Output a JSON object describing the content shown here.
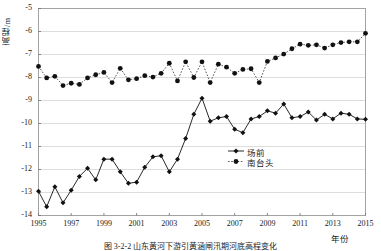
{
  "figure": {
    "caption": "图 3-2-2  山东黄河下游引黄涵闸汛期河底高程变化"
  },
  "chart_data": {
    "type": "line",
    "title": "",
    "xlabel": "年份",
    "ylabel": "高程/m",
    "xlim": [
      1995,
      2015
    ],
    "ylim": [
      -14,
      -5
    ],
    "yticks": [
      "-5",
      "-6",
      "-7",
      "-8",
      "-9",
      "-10",
      "-11",
      "-12",
      "-13",
      "-14"
    ],
    "ytick_values": [
      -5,
      -6,
      -7,
      -8,
      -9,
      -10,
      -11,
      -12,
      -13,
      -14
    ],
    "xticks": [
      "1995",
      "1997",
      "1999",
      "2001",
      "2003",
      "2005",
      "2007",
      "2009",
      "2011",
      "2013",
      "2015"
    ],
    "xtick_values": [
      1995,
      1997,
      1999,
      2001,
      2003,
      2005,
      2007,
      2009,
      2011,
      2013,
      2015
    ],
    "grid": "horizontal",
    "legend_position": "center-right",
    "x": [
      1995,
      1995.5,
      1996,
      1996.5,
      1997,
      1997.5,
      1998,
      1998.5,
      1999,
      1999.5,
      2000,
      2000.5,
      2001,
      2001.5,
      2002,
      2002.5,
      2003,
      2003.5,
      2004,
      2004.5,
      2005,
      2005.5,
      2006,
      2006.5,
      2007,
      2007.5,
      2008,
      2008.5,
      2009,
      2009.5,
      2010,
      2010.5,
      2011,
      2011.5,
      2012,
      2012.5,
      2013,
      2013.5,
      2014,
      2014.5,
      2015
    ],
    "series": [
      {
        "name": "场前",
        "marker": "diamond",
        "linestyle": "solid",
        "color": "#111111",
        "values": [
          -12.95,
          -13.62,
          -12.75,
          -13.45,
          -12.9,
          -12.3,
          -11.95,
          -12.45,
          -11.55,
          -11.55,
          -12.1,
          -12.6,
          -12.55,
          -11.9,
          -11.45,
          -11.4,
          -12.1,
          -11.55,
          -10.65,
          -9.6,
          -8.9,
          -9.9,
          -9.75,
          -9.7,
          -10.25,
          -10.4,
          -9.8,
          -9.7,
          -9.45,
          -9.55,
          -9.15,
          -9.75,
          -9.7,
          -9.5,
          -9.85,
          -9.6,
          -9.8,
          -9.55,
          -9.6,
          -9.8,
          -9.82
        ]
      },
      {
        "name": "南台头",
        "marker": "circle",
        "linestyle": "dotted",
        "color": "#111111",
        "values": [
          -7.52,
          -8.02,
          -7.95,
          -8.35,
          -8.25,
          -8.3,
          -8.02,
          -7.88,
          -7.78,
          -8.22,
          -7.6,
          -8.1,
          -8.05,
          -7.92,
          -7.98,
          -7.82,
          -7.38,
          -8.15,
          -7.32,
          -8.0,
          -7.32,
          -8.22,
          -7.42,
          -7.55,
          -7.82,
          -7.65,
          -7.62,
          -8.22,
          -7.3,
          -7.15,
          -6.98,
          -6.75,
          -6.55,
          -6.6,
          -6.58,
          -6.72,
          -6.58,
          -6.48,
          -6.45,
          -6.45,
          -6.08
        ]
      }
    ]
  }
}
